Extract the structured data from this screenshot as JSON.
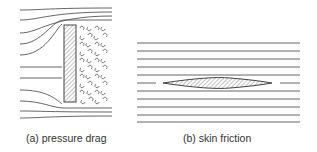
{
  "figure": {
    "panels": [
      {
        "id": "a",
        "caption": "(a) pressure drag",
        "description": "Streamlines deflect around a flat plate held normal to flow; turbulent eddies fill the wake behind it"
      },
      {
        "id": "b",
        "caption": "(b) skin friction",
        "description": "Straight parallel streamlines pass a thin streamlined body aligned with the flow"
      }
    ],
    "colors": {
      "line": "#555555",
      "hatch": "#777777",
      "background": "#ffffff"
    }
  }
}
